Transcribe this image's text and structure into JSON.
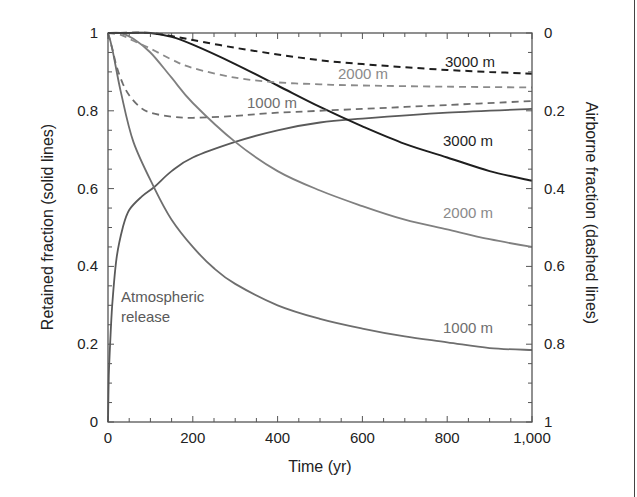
{
  "chart_data": {
    "type": "line",
    "title": "",
    "xlabel": "Time (yr)",
    "ylabel": "Retained fraction (solid lines)",
    "y2label": "Airborne fraction (dashed lines)",
    "xlim": [
      0,
      1000
    ],
    "ylim": [
      0,
      1
    ],
    "y2lim": [
      1,
      0
    ],
    "grid": false,
    "legend": "inline labels",
    "x_ticks": [
      "0",
      "200",
      "400",
      "600",
      "800",
      "1,000"
    ],
    "y_ticks": [
      "0",
      "0.2",
      "0.4",
      "0.6",
      "0.8",
      "1"
    ],
    "y2_ticks": [
      "1",
      "0.8",
      "0.6",
      "0.4",
      "0.2",
      "0"
    ],
    "series": [
      {
        "name": "Atmospheric release",
        "axis": "retained",
        "style": "solid",
        "color": "#5a5a5a",
        "x": [
          0,
          2,
          5,
          10,
          20,
          35,
          50,
          80,
          110,
          150,
          200,
          300,
          400,
          500,
          600,
          800,
          1000
        ],
        "values": [
          0,
          0.12,
          0.2,
          0.3,
          0.42,
          0.5,
          0.545,
          0.58,
          0.605,
          0.645,
          0.68,
          0.72,
          0.75,
          0.77,
          0.78,
          0.795,
          0.805
        ]
      },
      {
        "name": "1000 m",
        "axis": "retained",
        "style": "solid",
        "color": "#6e6e6e",
        "x": [
          0,
          10,
          30,
          60,
          110,
          150,
          200,
          250,
          300,
          400,
          500,
          600,
          700,
          800,
          900,
          1000
        ],
        "values": [
          1,
          0.96,
          0.85,
          0.72,
          0.6,
          0.52,
          0.45,
          0.395,
          0.355,
          0.3,
          0.265,
          0.24,
          0.22,
          0.205,
          0.19,
          0.185
        ]
      },
      {
        "name": "2000 m",
        "axis": "retained",
        "style": "solid",
        "color": "#808080",
        "x": [
          0,
          30,
          60,
          100,
          150,
          200,
          300,
          400,
          500,
          600,
          700,
          800,
          900,
          1000
        ],
        "values": [
          1,
          1,
          0.985,
          0.95,
          0.885,
          0.82,
          0.72,
          0.645,
          0.595,
          0.555,
          0.52,
          0.495,
          0.47,
          0.45
        ]
      },
      {
        "name": "3000 m",
        "axis": "retained",
        "style": "solid",
        "color": "#1e1e1e",
        "x": [
          0,
          50,
          100,
          150,
          200,
          300,
          400,
          500,
          600,
          700,
          800,
          900,
          1000
        ],
        "values": [
          1,
          1,
          1,
          0.99,
          0.97,
          0.92,
          0.865,
          0.81,
          0.76,
          0.715,
          0.68,
          0.645,
          0.62
        ]
      },
      {
        "name": "1000 m",
        "axis": "airborne",
        "style": "dashed",
        "color": "#6e6e6e",
        "x": [
          0,
          10,
          20,
          35,
          50,
          75,
          100,
          150,
          200,
          300,
          400,
          600,
          800,
          1000
        ],
        "values": [
          0,
          0.04,
          0.085,
          0.13,
          0.16,
          0.19,
          0.205,
          0.215,
          0.218,
          0.213,
          0.205,
          0.195,
          0.185,
          0.175
        ]
      },
      {
        "name": "2000 m",
        "axis": "airborne",
        "style": "dashed",
        "color": "#8a8a8a",
        "x": [
          0,
          30,
          60,
          100,
          150,
          200,
          300,
          400,
          500,
          600,
          800,
          1000
        ],
        "values": [
          0,
          0.005,
          0.02,
          0.04,
          0.068,
          0.09,
          0.115,
          0.127,
          0.132,
          0.135,
          0.138,
          0.14
        ]
      },
      {
        "name": "3000 m",
        "axis": "airborne",
        "style": "dashed",
        "color": "#1e1e1e",
        "x": [
          0,
          100,
          150,
          200,
          300,
          400,
          500,
          600,
          700,
          800,
          900,
          1000
        ],
        "values": [
          0,
          0,
          0.008,
          0.018,
          0.038,
          0.055,
          0.07,
          0.08,
          0.088,
          0.095,
          0.1,
          0.105
        ]
      }
    ],
    "annotations": [
      {
        "text": "3000 m",
        "near": "3000 m dashed"
      },
      {
        "text": "2000 m",
        "near": "2000 m dashed"
      },
      {
        "text": "1000 m",
        "near": "1000 m dashed"
      },
      {
        "text": "3000 m",
        "near": "3000 m solid"
      },
      {
        "text": "2000 m",
        "near": "2000 m solid"
      },
      {
        "text": "1000 m",
        "near": "1000 m solid"
      },
      {
        "text": "Atmospheric release",
        "near": "atmospheric release solid"
      }
    ]
  },
  "labels": {
    "xlabel": "Time (yr)",
    "ylabel": "Retained fraction (solid lines)",
    "y2label": "Airborne fraction (dashed lines)",
    "atm_line1": "Atmospheric",
    "atm_line2": "release",
    "dash3000": "3000 m",
    "dash2000": "2000 m",
    "dash1000": "1000 m",
    "solid3000": "3000 m",
    "solid2000": "2000 m",
    "solid1000": "1000 m"
  }
}
